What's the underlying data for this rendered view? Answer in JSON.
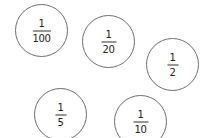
{
  "diagram": {
    "title": "",
    "stroke_color": "#6f6f6f",
    "text_color": "#222222",
    "cards": [
      {
        "id": "card-1-100",
        "numerator": "1",
        "denominator": "100",
        "cx": 42,
        "cy": 31
      },
      {
        "id": "card-1-20",
        "numerator": "1",
        "denominator": "20",
        "cx": 109,
        "cy": 42
      },
      {
        "id": "card-1-2",
        "numerator": "1",
        "denominator": "2",
        "cx": 173,
        "cy": 65
      },
      {
        "id": "card-1-5",
        "numerator": "1",
        "denominator": "5",
        "cx": 61,
        "cy": 115
      },
      {
        "id": "card-1-10",
        "numerator": "1",
        "denominator": "10",
        "cx": 141,
        "cy": 122
      }
    ]
  }
}
